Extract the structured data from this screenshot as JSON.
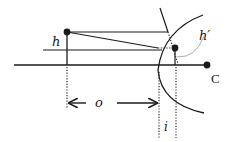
{
  "diagram": {
    "type": "optics-refraction-spherical-surface",
    "labels": {
      "object_height": "h",
      "image_height": "h′",
      "object_distance": "o",
      "image_distance": "i",
      "center_of_curvature": "C"
    },
    "colors": {
      "line": "#1a1a1a",
      "dotted": "#1a1a1a",
      "guide_arc": "#9a9a9a",
      "background": "#ffffff"
    }
  }
}
